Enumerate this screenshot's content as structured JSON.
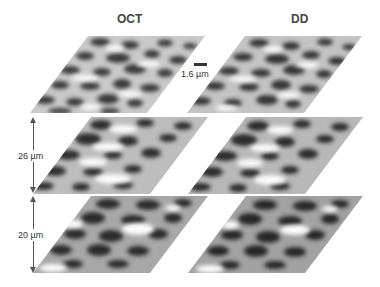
{
  "figure": {
    "columns": [
      {
        "title": "OCT"
      },
      {
        "title": "DD"
      }
    ],
    "scale_bar": {
      "label": "1.6 µm"
    },
    "depth_markers": [
      {
        "label": "26 µm"
      },
      {
        "label": "20 µm"
      }
    ],
    "rows": 3,
    "panel_style": "grayscale speckle texture maps in oblique (parallelogram) projection",
    "colors": {
      "background": "#ffffff",
      "dark": "#2e2e2e",
      "light": "#f4f4f4",
      "text": "#3a3a3a"
    }
  }
}
